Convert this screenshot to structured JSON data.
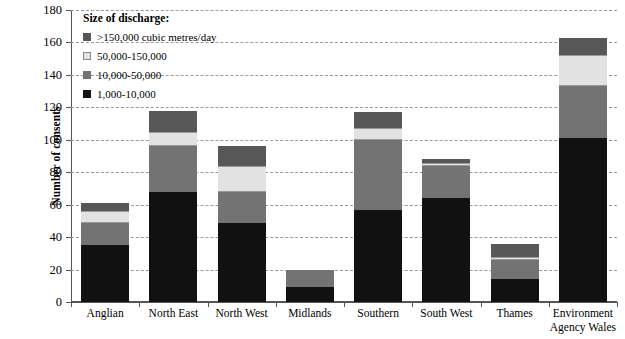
{
  "chart_data": {
    "type": "bar",
    "subtype": "stacked-bar",
    "title": "",
    "xlabel": "",
    "ylabel": "Number of consents",
    "ylim": [
      0,
      180
    ],
    "ytick_step": 20,
    "yticks": [
      0,
      20,
      40,
      60,
      80,
      100,
      120,
      140,
      160,
      180
    ],
    "grid": true,
    "grid_style": "dashed horizontal",
    "legend_position": "top-left inside plot",
    "categories": [
      "Anglian",
      "North East",
      "North West",
      "Midlands",
      "Southern",
      "South West",
      "Thames",
      "Environment Agency Wales"
    ],
    "series": [
      {
        "name": "1,000-10,000",
        "color": "#111111",
        "values": [
          35,
          68,
          49,
          9,
          57,
          64,
          14,
          101
        ]
      },
      {
        "name": "10,000-50,000",
        "color": "#737373",
        "values": [
          14,
          28,
          19,
          11,
          43,
          20,
          12,
          32
        ]
      },
      {
        "name": "50,000-150,000",
        "color": "#e2e2e2",
        "values": [
          7,
          9,
          16,
          0,
          7,
          2,
          2,
          19
        ]
      },
      {
        "name": ">150,000 cubic metres/day",
        "color": "#575757",
        "values": [
          5,
          13,
          12,
          0,
          10,
          2,
          8,
          11
        ]
      }
    ],
    "totals": [
      61,
      118,
      96,
      20,
      117,
      88,
      36,
      163
    ]
  },
  "legend": {
    "title": "Size of discharge:",
    "items": [
      {
        "label": ">150,000 cubic metres/day",
        "color": "#575757"
      },
      {
        "label": "50,000-150,000",
        "color": "#e2e2e2"
      },
      {
        "label": "10,000-50,000",
        "color": "#737373"
      },
      {
        "label": "1,000-10,000",
        "color": "#111111"
      }
    ]
  },
  "xlabels": [
    {
      "line1": "Anglian",
      "line2": ""
    },
    {
      "line1": "North East",
      "line2": ""
    },
    {
      "line1": "North West",
      "line2": ""
    },
    {
      "line1": "Midlands",
      "line2": ""
    },
    {
      "line1": "Southern",
      "line2": ""
    },
    {
      "line1": "South West",
      "line2": ""
    },
    {
      "line1": "Thames",
      "line2": ""
    },
    {
      "line1": "Environment",
      "line2": "Agency Wales"
    }
  ]
}
